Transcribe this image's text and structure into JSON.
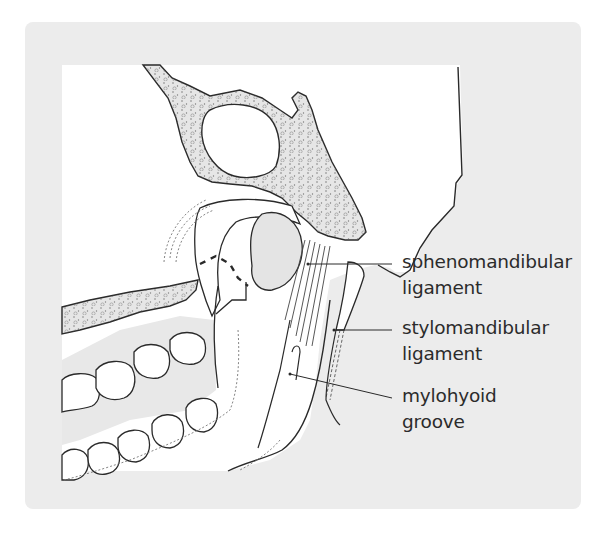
{
  "figure": {
    "labels": [
      {
        "id": "sphenomandibular",
        "lines": [
          "sphenomandibular",
          "ligament"
        ]
      },
      {
        "id": "stylomandibular",
        "lines": [
          "stylomandibular",
          "ligament"
        ]
      },
      {
        "id": "mylohyoid",
        "lines": [
          "mylohyoid",
          "groove"
        ]
      }
    ]
  },
  "colors": {
    "panel": "#ececec",
    "bone_fill": "#e6e6e6",
    "line": "#2a2a2a",
    "text": "#2b2b2b"
  }
}
